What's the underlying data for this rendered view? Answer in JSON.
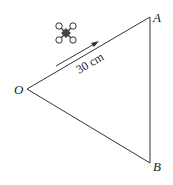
{
  "diagram": {
    "points": {
      "O": {
        "label": "O",
        "x": 27,
        "y": 89
      },
      "A": {
        "label": "A",
        "x": 150,
        "y": 17
      },
      "B": {
        "label": "B",
        "x": 150,
        "y": 163
      }
    },
    "distance_label": "30 cm",
    "drone_icon": "quadcopter-drone-icon",
    "arrow_direction": "O-to-A",
    "colors": {
      "stroke": "#333333",
      "drone_body": "#444444"
    }
  }
}
